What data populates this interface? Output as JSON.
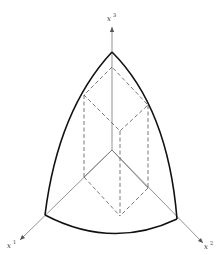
{
  "diagram": {
    "title": "",
    "axes": [
      {
        "id": "x1",
        "base": "x",
        "superscript": "1"
      },
      {
        "id": "x2",
        "base": "x",
        "superscript": "2"
      },
      {
        "id": "x3",
        "base": "x",
        "superscript": "3"
      }
    ],
    "colors": {
      "boundary": "#111111",
      "axis": "#777777",
      "dashed": "#555555"
    }
  }
}
